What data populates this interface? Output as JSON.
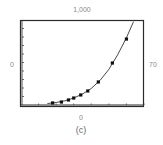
{
  "chart_data": {
    "type": "scatter",
    "title": "",
    "caption": "(c)",
    "xlabel": "",
    "ylabel": "",
    "window": {
      "xmin": 0,
      "xmax": 70,
      "ymin": 0,
      "ymax": 1000
    },
    "xlim": [
      0,
      70
    ],
    "ylim": [
      0,
      1000
    ],
    "x_tick_step": 10,
    "y_tick_step": 100,
    "grid": false,
    "legend": null,
    "window_labels": {
      "top": "1,000",
      "bottom": "0",
      "left": "0",
      "right": "70"
    },
    "series": [
      {
        "name": "data",
        "style": "square-markers",
        "x": [
          18,
          23,
          27,
          30,
          34,
          38,
          44,
          52,
          60
        ],
        "y": [
          24,
          35,
          59,
          82,
          118,
          165,
          271,
          494,
          776
        ]
      },
      {
        "name": "fitted exponential curve",
        "style": "line",
        "x": [
          15,
          20,
          25,
          30,
          35,
          40,
          45,
          50,
          55,
          60,
          64
        ],
        "y": [
          18,
          30,
          50,
          82,
          130,
          195,
          290,
          420,
          590,
          790,
          980
        ]
      }
    ]
  },
  "labels": {
    "top": "1,000",
    "bottom": "0",
    "left": "0",
    "right": "70",
    "caption": "(c)"
  },
  "colors": {
    "frame": "#2a2a2a",
    "curve": "#333333",
    "markers": "#111111",
    "labels": "#8a8a8a"
  }
}
